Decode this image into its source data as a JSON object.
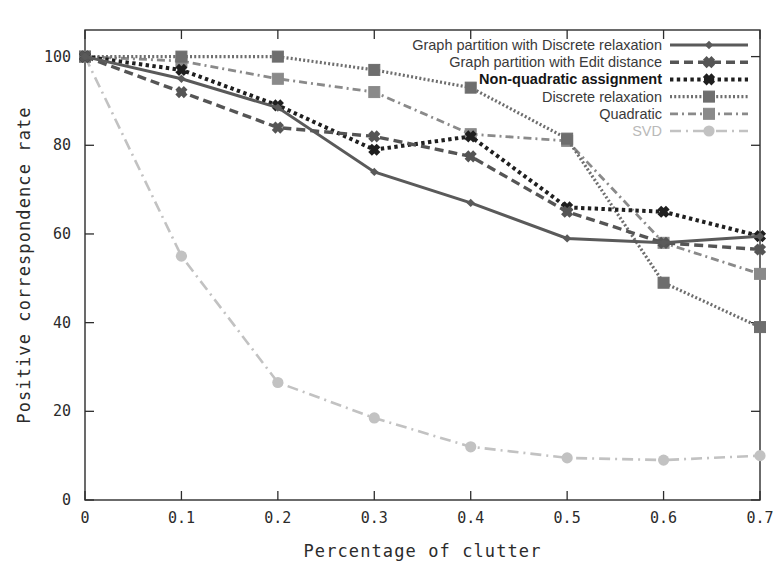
{
  "figure": {
    "background_color": "#ffffff",
    "axis_color": "#2d2d2d"
  },
  "axes": {
    "x_label": "Percentage of clutter",
    "y_label": "Positive correspondence rate",
    "x_ticks": [
      "0",
      "0.1",
      "0.2",
      "0.3",
      "0.4",
      "0.5",
      "0.6",
      "0.7"
    ],
    "y_ticks": [
      "0",
      "20",
      "40",
      "60",
      "80",
      "100"
    ],
    "x_min": 0,
    "x_max": 0.7,
    "y_min": 0,
    "y_max": 106
  },
  "legend": {
    "position": "top-right",
    "entries": [
      {
        "label": "Graph partition with Discrete relaxation",
        "color": "#5a5a5a",
        "style": "solid",
        "marker": "diamond",
        "bold": false,
        "faint": false
      },
      {
        "label": "Graph partition with Edit distance",
        "color": "#555555",
        "style": "dashed",
        "marker": "cross",
        "bold": false,
        "faint": false
      },
      {
        "label": "Non-quadratic assignment",
        "color": "#1f1f1f",
        "style": "dotted",
        "marker": "cross",
        "bold": true,
        "faint": false
      },
      {
        "label": "Discrete relaxation",
        "color": "#6e6e6e",
        "style": "fine-dotted",
        "marker": "square",
        "bold": false,
        "faint": false
      },
      {
        "label": "Quadratic",
        "color": "#8a8a8a",
        "style": "dash-dot",
        "marker": "square",
        "bold": false,
        "faint": false
      },
      {
        "label": "SVD",
        "color": "#c2c2c2",
        "style": "sparse-dash-dot",
        "marker": "circle",
        "bold": false,
        "faint": true
      }
    ]
  },
  "chart_data": {
    "type": "line",
    "title": "",
    "xlabel": "Percentage of clutter",
    "ylabel": "Positive correspondence rate",
    "xlim": [
      0,
      0.7
    ],
    "ylim": [
      0,
      106
    ],
    "grid": false,
    "legend_position": "top-right",
    "x": [
      0,
      0.1,
      0.2,
      0.3,
      0.4,
      0.5,
      0.6,
      0.7
    ],
    "series": [
      {
        "name": "Graph partition with Discrete relaxation",
        "color": "#5a5a5a",
        "style": "solid",
        "marker": "diamond",
        "values": [
          100,
          95,
          88.5,
          74,
          67,
          59,
          58,
          59.5
        ]
      },
      {
        "name": "Graph partition with Edit distance",
        "color": "#555555",
        "style": "dashed",
        "marker": "cross",
        "values": [
          100,
          92,
          84,
          82,
          77.5,
          65,
          58,
          56.5
        ]
      },
      {
        "name": "Non-quadratic assignment",
        "color": "#1f1f1f",
        "style": "dotted",
        "marker": "cross",
        "values": [
          100,
          97,
          89,
          79,
          82,
          66,
          65,
          59.5
        ]
      },
      {
        "name": "Discrete relaxation",
        "color": "#6e6e6e",
        "style": "fine-dotted",
        "marker": "square",
        "values": [
          100,
          100,
          100,
          97,
          93,
          81.5,
          49,
          39
        ]
      },
      {
        "name": "Quadratic",
        "color": "#8a8a8a",
        "style": "dash-dot",
        "marker": "square",
        "values": [
          100,
          99,
          95,
          92,
          82.5,
          81,
          58,
          51
        ]
      },
      {
        "name": "SVD",
        "color": "#c2c2c2",
        "style": "sparse-dash-dot",
        "marker": "circle",
        "values": [
          100,
          55,
          26.5,
          18.5,
          12,
          9.5,
          9,
          10
        ]
      }
    ]
  }
}
